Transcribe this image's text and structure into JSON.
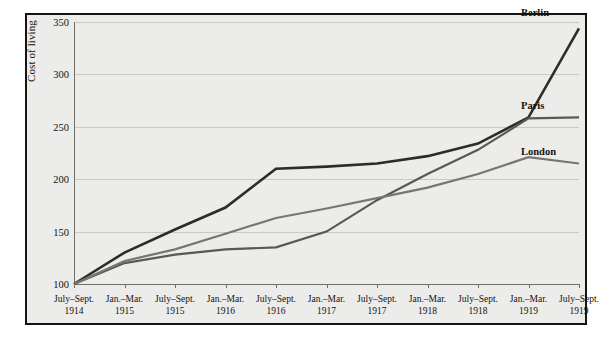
{
  "chart_data": {
    "type": "line",
    "title": "",
    "xlabel": "",
    "ylabel": "Cost of living",
    "ylim": [
      100,
      350
    ],
    "yticks": [
      100,
      150,
      200,
      250,
      300,
      350
    ],
    "grid": true,
    "legend_position": "inline-right",
    "categories": [
      "July–Sept.\n1914",
      "Jan.–Mar.\n1915",
      "July–Sept.\n1915",
      "Jan.–Mar.\n1916",
      "July–Sept.\n1916",
      "Jan.–Mar.\n1917",
      "July–Sept.\n1917",
      "Jan.–Mar.\n1918",
      "July–Sept.\n1918",
      "Jan.–Mar.\n1919",
      "July–Sept.\n1919"
    ],
    "category_periods": [
      "July–Sept.",
      "Jan.–Mar.",
      "July–Sept.",
      "Jan.–Mar.",
      "July–Sept.",
      "Jan.–Mar.",
      "July–Sept.",
      "Jan.–Mar.",
      "July–Sept.",
      "Jan.–Mar.",
      "July–Sept."
    ],
    "category_years": [
      "1914",
      "1915",
      "1915",
      "1916",
      "1916",
      "1917",
      "1917",
      "1918",
      "1918",
      "1919",
      "1919"
    ],
    "series": [
      {
        "name": "Berlin",
        "color": "#2e2c2a",
        "values": [
          100,
          130,
          152,
          173,
          210,
          212,
          215,
          222,
          234,
          259,
          344
        ]
      },
      {
        "name": "Paris",
        "color": "#585855",
        "values": [
          100,
          120,
          128,
          133,
          135,
          150,
          180,
          205,
          228,
          258,
          259
        ]
      },
      {
        "name": "London",
        "color": "#77766f",
        "values": [
          100,
          122,
          133,
          148,
          163,
          172,
          182,
          192,
          205,
          221,
          215
        ]
      }
    ]
  }
}
